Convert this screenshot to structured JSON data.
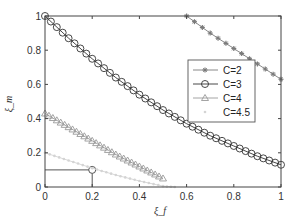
{
  "chart_data": {
    "type": "line",
    "title": "",
    "xlabel": "ξ_f",
    "ylabel": "ξ_m",
    "xlim": [
      0,
      1
    ],
    "ylim": [
      0,
      1
    ],
    "xticks": [
      "0",
      "0.2",
      "0.4",
      "0.6",
      "0.8",
      "1"
    ],
    "yticks": [
      "0",
      "0.2",
      "0.4",
      "0.6",
      "0.8",
      "1"
    ],
    "grid": false,
    "legend_position": "center-right",
    "series": [
      {
        "name": "C=2",
        "marker": "asterisk",
        "color": "#7a7a7a",
        "x": [
          0.6,
          0.7,
          0.8,
          0.9,
          1.0
        ],
        "y": [
          1.0,
          0.9,
          0.81,
          0.72,
          0.63
        ]
      },
      {
        "name": "C=3",
        "marker": "circle",
        "color": "#333333",
        "x": [
          0,
          0.1,
          0.2,
          0.3,
          0.4,
          0.5,
          0.6,
          0.7,
          0.8,
          0.9,
          1.0
        ],
        "y": [
          1.0,
          0.87,
          0.75,
          0.64,
          0.54,
          0.45,
          0.37,
          0.3,
          0.24,
          0.18,
          0.13
        ]
      },
      {
        "name": "C=4",
        "marker": "triangle",
        "color": "#9a9a9a",
        "x": [
          0,
          0.1,
          0.2,
          0.3,
          0.4,
          0.5
        ],
        "y": [
          0.43,
          0.35,
          0.27,
          0.19,
          0.12,
          0.05
        ]
      },
      {
        "name": "C=4.5",
        "marker": "point",
        "color": "#d4d4d4",
        "x": [
          0,
          0.1,
          0.2,
          0.3,
          0.4,
          0.5,
          0.55
        ],
        "y": [
          0.2,
          0.155,
          0.11,
          0.07,
          0.035,
          0.005,
          0.0
        ]
      }
    ],
    "annotations": [
      {
        "type": "reference-lines",
        "x": 0.2,
        "y": 0.1,
        "marker": "open-circle",
        "color": "#555555"
      }
    ]
  }
}
